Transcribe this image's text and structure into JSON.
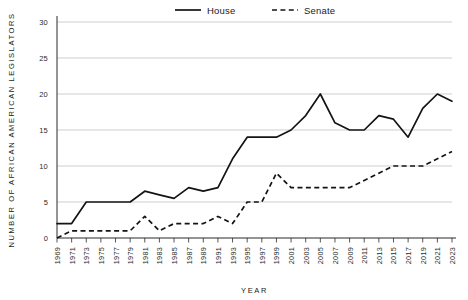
{
  "chart_data": {
    "type": "line",
    "title": "",
    "xlabel": "YEAR",
    "ylabel": "NUMBER OF AFRICAN AMERICAN LEGISLATORS",
    "xlim": [
      1969,
      2023
    ],
    "ylim": [
      0,
      30
    ],
    "yticks": [
      0,
      5,
      10,
      15,
      20,
      25,
      30
    ],
    "grid": true,
    "legend_position": "top-center",
    "categories": [
      1969,
      1971,
      1973,
      1975,
      1977,
      1979,
      1981,
      1983,
      1985,
      1987,
      1989,
      1991,
      1993,
      1995,
      1997,
      1999,
      2001,
      2003,
      2005,
      2007,
      2009,
      2011,
      2013,
      2015,
      2017,
      2019,
      2021,
      2023
    ],
    "xtick_labels": [
      "1969",
      "1971",
      "1973",
      "1975",
      "1977",
      "1979",
      "1981",
      "1983",
      "1985",
      "1987",
      "1989",
      "1991",
      "1993",
      "1995",
      "1997",
      "1999",
      "2001",
      "2003",
      "2005",
      "2007",
      "2009",
      "2011",
      "2013",
      "2015",
      "2017",
      "2019",
      "2021",
      "2023"
    ],
    "series": [
      {
        "name": "House",
        "style": "solid",
        "color": "#141414",
        "values": [
          2,
          2,
          5,
          5,
          5,
          5,
          6.5,
          6,
          5.5,
          7,
          6.5,
          7,
          11,
          14,
          14,
          14,
          15,
          17,
          20,
          16,
          15,
          15,
          17,
          16.5,
          14,
          18,
          20,
          19
        ]
      },
      {
        "name": "Senate",
        "style": "dashed",
        "color": "#141414",
        "values": [
          0,
          1,
          1,
          1,
          1,
          1,
          3,
          1,
          2,
          2,
          2,
          3,
          2,
          5,
          5,
          9,
          7,
          7,
          7,
          7,
          7,
          8,
          9,
          10,
          10,
          10,
          11,
          12
        ]
      }
    ]
  },
  "legend": {
    "items": [
      {
        "label": "House",
        "style": "solid"
      },
      {
        "label": "Senate",
        "style": "dashed"
      }
    ]
  }
}
